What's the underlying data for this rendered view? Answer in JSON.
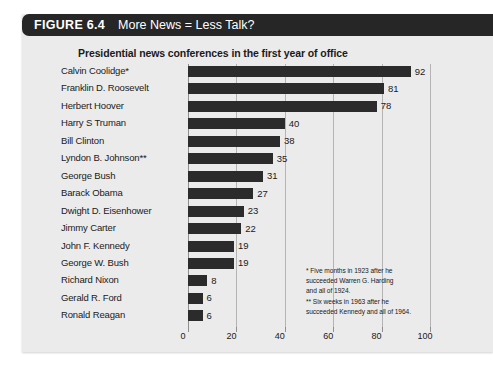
{
  "figure": {
    "number": "FIGURE 6.4",
    "title": "More News = Less Talk?",
    "subtitle": "Presidential news conferences in the first year of office",
    "banner_color": "#262626",
    "panel_color": "#ebebeb",
    "bar_color": "#2b2b2b"
  },
  "footnote": {
    "line1": "* Five months in 1923 after he",
    "line2": "succeeded Warren G. Harding",
    "line3": "and all of 1924.",
    "line4": "** Six weeks in 1963 after he",
    "line5": "succeeded Kennedy and all of 1964."
  },
  "chart_data": {
    "type": "bar",
    "orientation": "horizontal",
    "title": "More News = Less Talk?",
    "subtitle": "Presidential news conferences in the first year of office",
    "xlabel": "",
    "ylabel": "",
    "xlim": [
      0,
      100
    ],
    "xticks": [
      0,
      20,
      40,
      60,
      80,
      100
    ],
    "grid": true,
    "legend": false,
    "categories": [
      "Calvin Coolidge*",
      "Franklin D. Roosevelt",
      "Herbert Hoover",
      "Harry S Truman",
      "Bill Clinton",
      "Lyndon B. Johnson**",
      "George Bush",
      "Barack Obama",
      "Dwight D. Eisenhower",
      "Jimmy Carter",
      "John F. Kennedy",
      "George W. Bush",
      "Richard Nixon",
      "Gerald R. Ford",
      "Ronald Reagan"
    ],
    "values": [
      92,
      81,
      78,
      40,
      38,
      35,
      31,
      27,
      23,
      22,
      19,
      19,
      8,
      6,
      6
    ],
    "annotations": [
      "* Five months in 1923 after he succeeded Warren G. Harding and all of 1924.",
      "** Six weeks in 1963 after he succeeded Kennedy and all of 1964."
    ]
  }
}
